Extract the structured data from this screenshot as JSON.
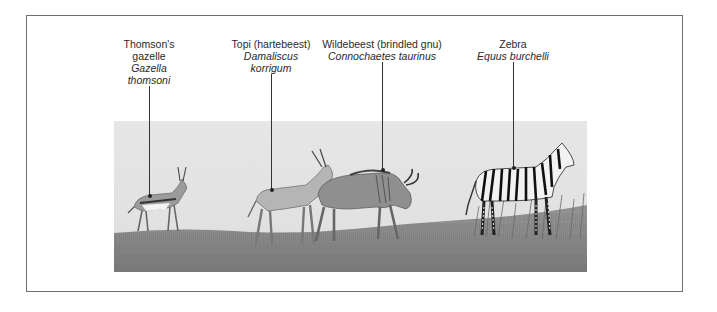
{
  "figure": {
    "background": "#ffffff",
    "frame_color": "#6e6e6e",
    "scene_sky_color": "#e3e3e3",
    "grass_color": "#8a8a8a"
  },
  "animals": [
    {
      "id": "thomsons-gazelle",
      "common_name_line1": "Thomson's",
      "common_name_line2": "gazelle",
      "scientific_name_line1": "Gazella",
      "scientific_name_line2": "thomsoni",
      "label_x": 149,
      "leader_top": 80,
      "leader_bottom": 196
    },
    {
      "id": "topi",
      "common_name_line1": "Topi (hartebeest)",
      "scientific_name_line1": "Damaliscus",
      "scientific_name_line2": "korrigum",
      "label_x": 271,
      "leader_top": 70,
      "leader_bottom": 190
    },
    {
      "id": "wildebeest",
      "common_name_line1": "Wildebeest (brindled gnu)",
      "scientific_name_line1": "Connochaetes taurinus",
      "label_x": 382,
      "leader_top": 58,
      "leader_bottom": 170
    },
    {
      "id": "zebra",
      "common_name_line1": "Zebra",
      "scientific_name_line1": "Equus burchelli",
      "label_x": 513,
      "leader_top": 58,
      "leader_bottom": 168
    }
  ]
}
